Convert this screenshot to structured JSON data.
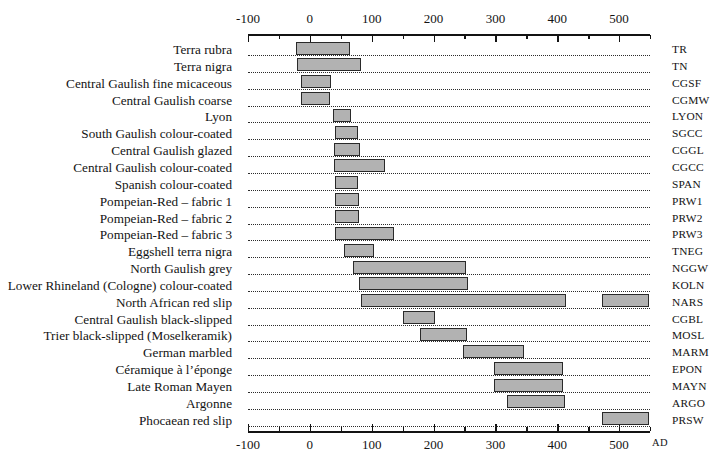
{
  "chart_data": {
    "type": "bar",
    "orientation": "horizontal-range",
    "title": "",
    "xlabel": "AD",
    "ylabel": "",
    "xlim": [
      -100,
      550
    ],
    "grid": "dotted-row-guides",
    "legend": "none",
    "axis_note": "AD",
    "x_ticks_major": [
      -100,
      0,
      100,
      200,
      300,
      400,
      500
    ],
    "x_ticks_major_labels": [
      "-100",
      "0",
      "100",
      "200",
      "300",
      "400",
      "500"
    ],
    "x_ticks_minor": [
      -50,
      50,
      150,
      250,
      350,
      450,
      550
    ],
    "bar_fill": "#b2b2b2",
    "bar_stroke": "#2a2a2a",
    "categories": [
      {
        "label": "Terra rubra",
        "code": "TR",
        "ranges": [
          [
            -23,
            65
          ]
        ]
      },
      {
        "label": "Terra nigra",
        "code": "TN",
        "ranges": [
          [
            -21,
            83
          ]
        ]
      },
      {
        "label": "Central Gaulish fine micaceous",
        "code": "CGSF",
        "ranges": [
          [
            -14,
            34
          ]
        ]
      },
      {
        "label": "Central Gaulish coarse",
        "code": "CGMW",
        "ranges": [
          [
            -14,
            33
          ]
        ]
      },
      {
        "label": "Lyon",
        "code": "LYON",
        "ranges": [
          [
            37,
            67
          ]
        ]
      },
      {
        "label": "South Gaulish colour-coated",
        "code": "SGCC",
        "ranges": [
          [
            40,
            78
          ]
        ]
      },
      {
        "label": "Central Gaulish glazed",
        "code": "CGGL",
        "ranges": [
          [
            39,
            81
          ]
        ]
      },
      {
        "label": "Central Gaulish colour-coated",
        "code": "CGCC",
        "ranges": [
          [
            39,
            122
          ]
        ]
      },
      {
        "label": "Spanish colour-coated",
        "code": "SPAN",
        "ranges": [
          [
            40,
            78
          ]
        ]
      },
      {
        "label": "Pompeian-Red – fabric 1",
        "code": "PRW1",
        "ranges": [
          [
            40,
            79
          ]
        ]
      },
      {
        "label": "Pompeian-Red – fabric 2",
        "code": "PRW2",
        "ranges": [
          [
            40,
            79
          ]
        ]
      },
      {
        "label": "Pompeian-Red – fabric 3",
        "code": "PRW3",
        "ranges": [
          [
            40,
            136
          ]
        ]
      },
      {
        "label": "Eggshell terra nigra",
        "code": "TNEG",
        "ranges": [
          [
            56,
            104
          ]
        ]
      },
      {
        "label": "North Gaulish grey",
        "code": "NGGW",
        "ranges": [
          [
            70,
            252
          ]
        ]
      },
      {
        "label": "Lower Rhineland (Cologne) colour-coated",
        "code": "KOLN",
        "ranges": [
          [
            79,
            255
          ]
        ]
      },
      {
        "label": "North African red slip",
        "code": "NARS",
        "ranges": [
          [
            83,
            414
          ],
          [
            473,
            549
          ]
        ]
      },
      {
        "label": "Central Gaulish black-slipped",
        "code": "CGBL",
        "ranges": [
          [
            150,
            202
          ]
        ]
      },
      {
        "label": "Trier black-slipped (Moselkeramik)",
        "code": "MOSL",
        "ranges": [
          [
            178,
            254
          ]
        ]
      },
      {
        "label": "German marbled",
        "code": "MARM",
        "ranges": [
          [
            248,
            347
          ]
        ]
      },
      {
        "label": "Céramique à l’éponge",
        "code": "EPON",
        "ranges": [
          [
            298,
            410
          ]
        ]
      },
      {
        "label": "Late Roman Mayen",
        "code": "MAYN",
        "ranges": [
          [
            298,
            410
          ]
        ]
      },
      {
        "label": "Argonne",
        "code": "ARGO",
        "ranges": [
          [
            319,
            412
          ]
        ]
      },
      {
        "label": "Phocaean red slip",
        "code": "PRSW",
        "ranges": [
          [
            473,
            549
          ]
        ]
      }
    ]
  }
}
